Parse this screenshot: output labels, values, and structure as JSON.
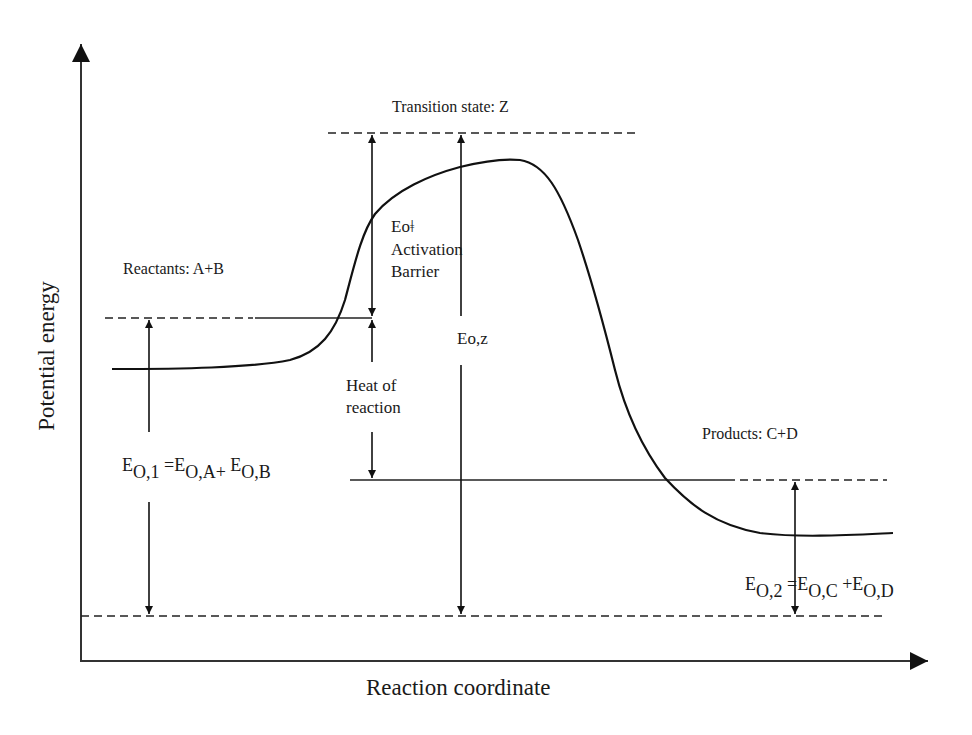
{
  "diagram": {
    "type": "potential-energy-reaction-profile",
    "axes": {
      "y_label": "Potential energy",
      "x_label": "Reaction coordinate"
    },
    "labels": {
      "transition_state": "Transition state: Z",
      "reactants": "Reactants: A+B",
      "products": "Products: C+D",
      "activation_symbol": "Eoǂ",
      "activation_line1": "Activation",
      "activation_line2": "Barrier",
      "eoz": "Eo,z",
      "heat_line1": "Heat of",
      "heat_line2": "reaction"
    },
    "equations": {
      "reactant_energy": {
        "lhs_main": "E",
        "lhs_sub": "O,1",
        "eq": " =",
        "t1_main": "E",
        "t1_sub": "O,A",
        "plus": "+ ",
        "t2_main": "E",
        "t2_sub": "O,B"
      },
      "product_energy": {
        "lhs_main": "E",
        "lhs_sub": "O,2",
        "eq": " =",
        "t1_main": "E",
        "t1_sub": "O,C",
        "plus": " +",
        "t2_main": "E",
        "t2_sub": "O,D"
      }
    },
    "levels": {
      "transition_state_y": 133,
      "reactant_level_y": 318,
      "product_level_y": 480,
      "zero_level_y": 616
    },
    "colors": {
      "line": "#111111",
      "text": "#1a1a1a",
      "background": "#ffffff"
    }
  }
}
